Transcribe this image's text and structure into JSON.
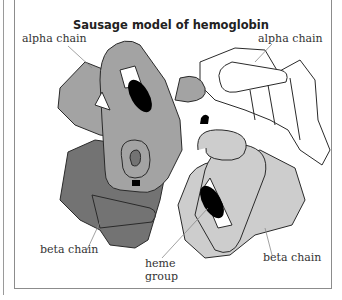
{
  "diagram": {
    "title": "Sausage model of hemoglobin",
    "labels": {
      "alpha_left": "alpha chain",
      "alpha_right": "alpha chain",
      "beta_left": "beta chain",
      "beta_right": "beta chain",
      "heme_line1": "heme",
      "heme_line2": "group"
    },
    "colors": {
      "alpha_left": "#a3a3a3",
      "alpha_right": "#ffffff",
      "beta_left": "#737373",
      "beta_right": "#cdcdcd",
      "heme": "#000000",
      "outline": "#2a2a2a"
    }
  }
}
